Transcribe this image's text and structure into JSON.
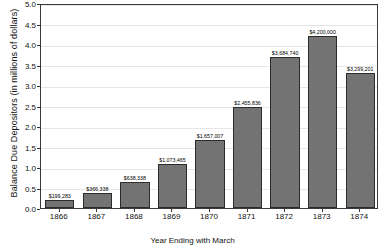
{
  "chart_data": {
    "type": "bar",
    "title": "",
    "xlabel": "Year Ending with March",
    "ylabel": "Balance Due Depositors (in millions of dollars)",
    "categories": [
      "1866",
      "1867",
      "1868",
      "1869",
      "1870",
      "1871",
      "1872",
      "1873",
      "1874"
    ],
    "values": [
      0.199283,
      0.366338,
      0.638338,
      1.073465,
      1.657007,
      2.455836,
      3.68474,
      4.2,
      3.299201
    ],
    "data_labels": [
      "$199,283",
      "$366,338",
      "$638,338",
      "$1,073,465",
      "$1,657,007",
      "$2,455,836",
      "$3,684,740",
      "$4,200,000",
      "$3,299,201"
    ],
    "ylim": [
      0.0,
      5.0
    ],
    "yticks": [
      "0.0",
      "0.5",
      "1.0",
      "1.5",
      "2.0",
      "2.5",
      "3.0",
      "3.5",
      "4.0",
      "4.5",
      "5.0"
    ],
    "ytick_values": [
      0.0,
      0.5,
      1.0,
      1.5,
      2.0,
      2.5,
      3.0,
      3.5,
      4.0,
      4.5,
      5.0
    ],
    "grid": true,
    "legend": null,
    "bar_color": "#737373",
    "bar_edge_color": "#2b2b2b",
    "grid_color": "#e6e6e6",
    "axis_color": "#3a3a3a",
    "background": "#ffffff"
  }
}
